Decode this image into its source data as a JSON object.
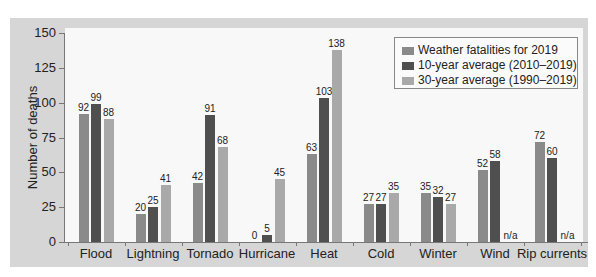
{
  "chart_data": {
    "type": "bar",
    "title": "",
    "xlabel": "",
    "ylabel": "Number of deaths",
    "ylim": [
      0,
      150
    ],
    "yticks": [
      0,
      25,
      50,
      75,
      100,
      125,
      150
    ],
    "grid": false,
    "legend_position": "top-right",
    "categories": [
      "Flood",
      "Lightning",
      "Tornado",
      "Hurricane",
      "Heat",
      "Cold",
      "Winter",
      "Wind",
      "Rip currents"
    ],
    "series": [
      {
        "name": "Weather fatalities for 2019",
        "color": "#8a8a8a",
        "values": [
          92,
          20,
          42,
          0,
          63,
          27,
          35,
          52,
          72
        ]
      },
      {
        "name": "10-year average (2010–2019)",
        "color": "#4f4f4f",
        "values": [
          99,
          25,
          91,
          5,
          103,
          27,
          32,
          58,
          60
        ]
      },
      {
        "name": "30-year average (1990–2019)",
        "color": "#a9a9a9",
        "values": [
          88,
          41,
          68,
          45,
          138,
          35,
          27,
          null,
          null
        ]
      }
    ],
    "annotations": {
      "missing_label": "n/a"
    }
  },
  "legend": {
    "items": [
      {
        "label": "Weather fatalities for 2019",
        "color": "#8a8a8a"
      },
      {
        "label": "10-year average (2010–2019)",
        "color": "#4f4f4f"
      },
      {
        "label": "30-year average (1990–2019)",
        "color": "#a9a9a9"
      }
    ]
  }
}
